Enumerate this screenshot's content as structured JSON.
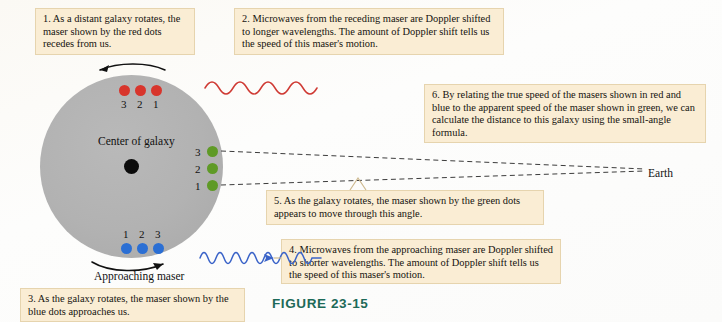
{
  "figure": {
    "label": "FIGURE 23-15",
    "label_color": "#1d6a58"
  },
  "colors": {
    "callout_bg": "#faedd4",
    "callout_border": "#e6d4ae",
    "galaxy_fill": "#b2b2b2",
    "red_dot": "#d8352c",
    "blue_dot": "#2b6fd4",
    "green_dot": "#5f9a26",
    "center_dot": "#0b0b0b",
    "red_wave": "#cf3a34",
    "blue_wave": "#3a63c8",
    "page_bg": "#fdfcfa"
  },
  "callouts": [
    {
      "id": "callout-1",
      "text": "1. As a distant galaxy rotates, the maser shown by the red dots recedes from us."
    },
    {
      "id": "callout-2",
      "text": "2. Microwaves from the receding maser are Doppler shifted to longer wavelengths. The amount of Doppler shift tells us the speed of this maser's motion."
    },
    {
      "id": "callout-3",
      "text": "3. As the galaxy rotates, the maser shown by the blue dots approaches us."
    },
    {
      "id": "callout-4",
      "text": "4. Microwaves from the approaching maser are Doppler shifted to shorter wavelengths. The amount of Doppler shift tells us the speed of this maser's motion."
    },
    {
      "id": "callout-5",
      "text": "5. As the galaxy rotates, the maser shown by the green dots appears to move through this angle."
    },
    {
      "id": "callout-6",
      "text": "6. By relating the true speed of the masers shown in red and blue to the apparent speed of the maser shown in green, we can calculate the distance to this galaxy using the small-angle formula."
    }
  ],
  "diagram": {
    "center_label": "Center of galaxy",
    "approaching_label": "Approaching maser",
    "earth_label": "Earth",
    "red_maser": {
      "color": "#d8352c",
      "labels": [
        "3",
        "2",
        "1"
      ],
      "description": "receding maser dots along top of galaxy"
    },
    "blue_maser": {
      "color": "#2b6fd4",
      "labels": [
        "1",
        "2",
        "3"
      ],
      "description": "approaching maser dots along bottom of galaxy"
    },
    "green_maser": {
      "color": "#5f9a26",
      "labels": [
        "3",
        "2",
        "1"
      ],
      "description": "transverse maser dots on right edge of galaxy"
    },
    "waves": {
      "red": {
        "label": "redshifted microwave wave",
        "cycles": 4,
        "direction": "right"
      },
      "blue": {
        "label": "blueshifted microwave wave",
        "cycles": 7,
        "direction": "right"
      }
    },
    "rotation_arrows": {
      "top": "counterclockwise arrow above galaxy pointing left",
      "bottom": "arrow below galaxy pointing right"
    }
  }
}
